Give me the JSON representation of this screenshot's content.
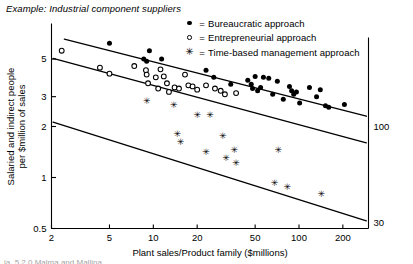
{
  "figure": {
    "title": "Example: Industrial component suppliers",
    "bottom_cropped_text": "ja. 5.2.0 Malma and Mallina"
  },
  "legend": {
    "equals": "=",
    "items": [
      {
        "marker": "filled-dot",
        "glyph": "●",
        "label": "Bureaucratic approach"
      },
      {
        "marker": "open-circle",
        "glyph": "○",
        "label": "Entrepreneurial approach"
      },
      {
        "marker": "star",
        "glyph": "✳",
        "label": "Time-based management approach"
      }
    ]
  },
  "chart_data": {
    "type": "scatter",
    "title": "Example: Industrial component suppliers",
    "xlabel": "Plant sales/Product family ($millions)",
    "ylabel": "Salaried and indirect people per $million of sales",
    "xscale": "log",
    "yscale": "log",
    "xlim": [
      2,
      300
    ],
    "ylim": [
      0.5,
      8
    ],
    "grid": false,
    "legend_position": "top-right",
    "xticks": [
      2,
      5,
      10,
      20,
      50,
      100,
      200
    ],
    "xticklabels": [
      "2",
      "5",
      "10",
      "20",
      "50",
      "100",
      "200"
    ],
    "yticks": [
      5,
      3,
      2,
      1,
      0.5
    ],
    "yticklabels": [
      "5",
      "3",
      "2",
      "1",
      "0.5"
    ],
    "right_edge_labels": [
      {
        "text": "100",
        "y": 2.0
      },
      {
        "text": "30",
        "y": 0.54
      }
    ],
    "series": [
      {
        "name": "Bureaucratic approach",
        "marker": "filled-dot",
        "points": [
          [
            5.0,
            6.2
          ],
          [
            9.4,
            5.6
          ],
          [
            8.6,
            5.0
          ],
          [
            9.0,
            4.85
          ],
          [
            11.4,
            5.0
          ],
          [
            23.0,
            4.3
          ],
          [
            26.0,
            3.9
          ],
          [
            34.0,
            3.55
          ],
          [
            44.5,
            3.75
          ],
          [
            47.0,
            3.55
          ],
          [
            48.0,
            3.35
          ],
          [
            50.0,
            3.95
          ],
          [
            52.0,
            3.25
          ],
          [
            54.5,
            3.4
          ],
          [
            57.0,
            3.9
          ],
          [
            62.0,
            3.85
          ],
          [
            66.0,
            3.1
          ],
          [
            71.0,
            3.7
          ],
          [
            78.0,
            2.9
          ],
          [
            86.0,
            3.45
          ],
          [
            89.0,
            3.25
          ],
          [
            92.0,
            3.1
          ],
          [
            96.0,
            3.2
          ],
          [
            101.0,
            2.75
          ],
          [
            118.0,
            3.4
          ],
          [
            132.0,
            3.0
          ],
          [
            140.0,
            3.3
          ],
          [
            152.0,
            2.65
          ],
          [
            160.0,
            2.6
          ],
          [
            205.0,
            2.7
          ]
        ]
      },
      {
        "name": "Entrepreneurial approach",
        "marker": "open-circle",
        "points": [
          [
            2.35,
            5.6
          ],
          [
            4.3,
            4.45
          ],
          [
            5.0,
            4.1
          ],
          [
            7.4,
            4.55
          ],
          [
            8.9,
            4.3
          ],
          [
            9.0,
            4.05
          ],
          [
            9.2,
            3.6
          ],
          [
            10.4,
            3.9
          ],
          [
            10.8,
            3.35
          ],
          [
            11.2,
            4.35
          ],
          [
            11.8,
            3.95
          ],
          [
            12.4,
            3.6
          ],
          [
            12.8,
            3.2
          ],
          [
            14.0,
            3.4
          ],
          [
            15.0,
            3.35
          ],
          [
            16.5,
            4.05
          ],
          [
            17.4,
            3.5
          ],
          [
            18.6,
            3.45
          ],
          [
            20.0,
            3.3
          ],
          [
            23.0,
            3.5
          ],
          [
            26.5,
            3.35
          ],
          [
            29.0,
            3.25
          ],
          [
            31.0,
            3.1
          ],
          [
            37.0,
            3.15
          ]
        ]
      },
      {
        "name": "Time-based management approach",
        "marker": "star",
        "points": [
          [
            9.0,
            2.85
          ],
          [
            13.8,
            2.7
          ],
          [
            20.0,
            2.35
          ],
          [
            24.5,
            2.35
          ],
          [
            14.6,
            1.8
          ],
          [
            15.4,
            1.62
          ],
          [
            23.0,
            1.42
          ],
          [
            30.0,
            1.75
          ],
          [
            31.5,
            1.3
          ],
          [
            36.0,
            1.45
          ],
          [
            37.0,
            1.22
          ],
          [
            72.0,
            1.45
          ],
          [
            68.0,
            0.93
          ],
          [
            83.0,
            0.88
          ],
          [
            142.0,
            0.8
          ]
        ]
      }
    ],
    "fit_lines": [
      {
        "series": "Bureaucratic approach",
        "x": [
          2.45,
          290
        ],
        "y": [
          6.55,
          2.3
        ]
      },
      {
        "series": "Entrepreneurial approach",
        "x": [
          2.05,
          290
        ],
        "y": [
          5.05,
          1.6
        ]
      },
      {
        "series": "Time-based management approach",
        "x": [
          2.05,
          290
        ],
        "y": [
          2.12,
          0.555
        ]
      }
    ]
  }
}
